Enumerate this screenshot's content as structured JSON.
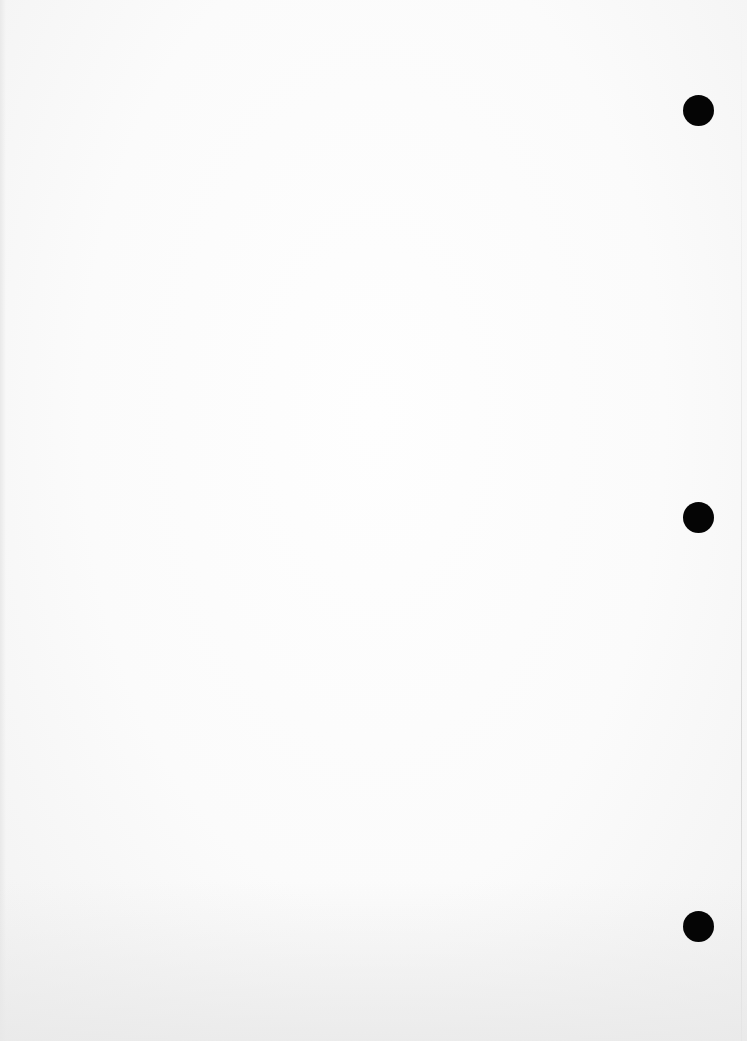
{
  "document": {
    "type": "blank scanned page",
    "background_color": "#fbfbfb",
    "bleed_through_text": "",
    "punch_holes": [
      {
        "name": "top",
        "x": 683,
        "y": 95,
        "color": "#050505"
      },
      {
        "name": "middle",
        "x": 683,
        "y": 502,
        "color": "#050505"
      },
      {
        "name": "bottom",
        "x": 683,
        "y": 911,
        "color": "#050505"
      }
    ]
  }
}
